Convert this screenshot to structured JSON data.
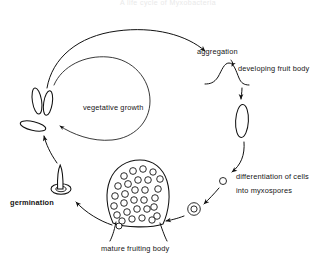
{
  "page": {
    "title_faint": "A life cycle of Myxobacteria",
    "background_color": "#ffffff",
    "ink_color": "#111111"
  },
  "diagram": {
    "name": "myxobacteria-life-cycle",
    "labels": {
      "aggregation": "aggregation",
      "developing_fruit_body": "developing fruit body",
      "differentiation_line1": "differentiation of cells",
      "differentiation_line2": "into myxospores",
      "mature_fruiting_body": "mature fruiting body",
      "germination": "germination",
      "vegetative_growth": "vegetative growth"
    },
    "stages": [
      {
        "id": "vegetative-cells",
        "label": "vegetative growth",
        "shape": "rod-cells"
      },
      {
        "id": "aggregation",
        "label": "aggregation",
        "shape": "arrow-arc"
      },
      {
        "id": "developing-fruit-body",
        "label": "developing fruit body",
        "shape": "mound"
      },
      {
        "id": "elongating-fruit-body",
        "label": "",
        "shape": "vertical-oval"
      },
      {
        "id": "differentiation",
        "label": "differentiation of cells into myxospores",
        "shape": "small-circle"
      },
      {
        "id": "myxospore",
        "label": "",
        "shape": "double-ring"
      },
      {
        "id": "mature-fruiting-body",
        "label": "mature fruiting body",
        "shape": "spore-filled-dome"
      },
      {
        "id": "germination",
        "label": "germination",
        "shape": "ring-with-emerging-rod"
      }
    ],
    "spore_count": 30
  }
}
